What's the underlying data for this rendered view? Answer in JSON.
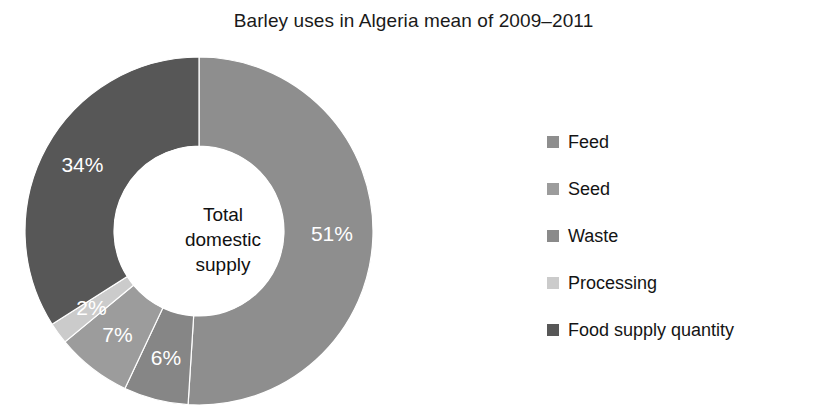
{
  "chart_data": {
    "type": "pie",
    "variant": "donut",
    "title": "Barley uses in Algeria mean of 2009–2011",
    "xlabel": "",
    "ylabel": "",
    "center_label_lines": [
      "Total",
      "domestic",
      "supply"
    ],
    "legend_position": "right",
    "grid": false,
    "start_angle_deg": 0,
    "direction": "clockwise",
    "units": "percent",
    "categories": [
      "Feed",
      "Seed",
      "Waste",
      "Processing",
      "Food supply quantity"
    ],
    "values": [
      51,
      6,
      7,
      2,
      34
    ],
    "data_labels": [
      "51%",
      "6%",
      "7%",
      "2%",
      "34%"
    ],
    "colors": [
      "#8e8e8e",
      "#868686",
      "#9c9c9c",
      "#cbcbcb",
      "#575757"
    ],
    "slices": [
      {
        "name": "Feed",
        "value": 51,
        "label": "51%",
        "color": "#8e8e8e"
      },
      {
        "name": "Seed",
        "value": 6,
        "label": "6%",
        "color": "#868686"
      },
      {
        "name": "Waste",
        "value": 7,
        "label": "7%",
        "color": "#9c9c9c"
      },
      {
        "name": "Processing",
        "value": 2,
        "label": "2%",
        "color": "#cbcbcb"
      },
      {
        "name": "Food supply quantity",
        "value": 34,
        "label": "34%",
        "color": "#575757"
      }
    ]
  },
  "legend": {
    "items": [
      {
        "label": "Feed",
        "color": "#8e8e8e"
      },
      {
        "label": "Seed",
        "color": "#9c9c9c"
      },
      {
        "label": "Waste",
        "color": "#8a8a8a"
      },
      {
        "label": "Processing",
        "color": "#cbcbcb"
      },
      {
        "label": "Food supply quantity",
        "color": "#575757"
      }
    ]
  }
}
